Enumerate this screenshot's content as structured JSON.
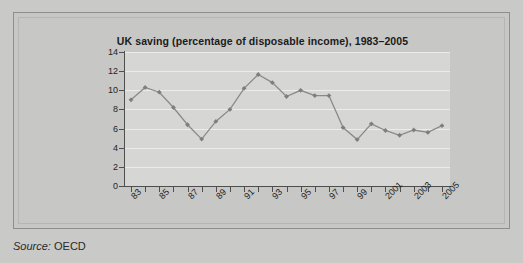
{
  "figure": {
    "source_label": "Source:",
    "source_value": "OECD"
  },
  "colors": {
    "page_background": "#c9c9c7",
    "frame_background": "#c7c7c5",
    "frame_border": "#8e8e8c",
    "plot_background": "#d6d6d4",
    "gridline": "#ececeb",
    "axis": "#4e4e4e",
    "series_line": "#8a8a88",
    "series_marker": "#7e7e7c",
    "title_text": "#1b1b1b"
  },
  "chart_data": {
    "type": "line",
    "title": "UK saving (percentage of disposable income), 1983–2005",
    "xlabel": "",
    "ylabel": "",
    "ylim": [
      0,
      14
    ],
    "ytick_step": 2,
    "yticks": [
      14,
      12,
      10,
      8,
      6,
      4,
      2,
      0
    ],
    "grid": true,
    "grid_axis": "y",
    "legend": false,
    "legend_position": "none",
    "x": [
      1983,
      1984,
      1985,
      1986,
      1987,
      1988,
      1989,
      1990,
      1991,
      1992,
      1993,
      1994,
      1995,
      1996,
      1997,
      1998,
      1999,
      2000,
      2001,
      2002,
      2003,
      2004,
      2005
    ],
    "categories": [
      "83",
      "84",
      "85",
      "86",
      "87",
      "88",
      "89",
      "90",
      "91",
      "92",
      "93",
      "94",
      "95",
      "96",
      "97",
      "98",
      "99",
      "2000",
      "2001",
      "2002",
      "2003",
      "2004",
      "2005"
    ],
    "xtick_labels_shown": [
      "83",
      "85",
      "87",
      "89",
      "91",
      "93",
      "95",
      "97",
      "99",
      "2001",
      "2003",
      "2005"
    ],
    "xtick_label_rotation": -45,
    "values": [
      9.0,
      10.3,
      9.8,
      8.2,
      6.4,
      4.9,
      6.75,
      8.0,
      10.2,
      11.65,
      10.8,
      9.35,
      10.0,
      9.45,
      9.45,
      6.1,
      4.85,
      6.5,
      5.8,
      5.3,
      5.85,
      5.6,
      6.3
    ],
    "series": [
      {
        "name": "UK saving ratio",
        "values": [
          9.0,
          10.3,
          9.8,
          8.2,
          6.4,
          4.9,
          6.75,
          8.0,
          10.2,
          11.65,
          10.8,
          9.35,
          10.0,
          9.45,
          9.45,
          6.1,
          4.85,
          6.5,
          5.8,
          5.3,
          5.85,
          5.6,
          6.3
        ]
      }
    ],
    "marker": "diamond"
  }
}
